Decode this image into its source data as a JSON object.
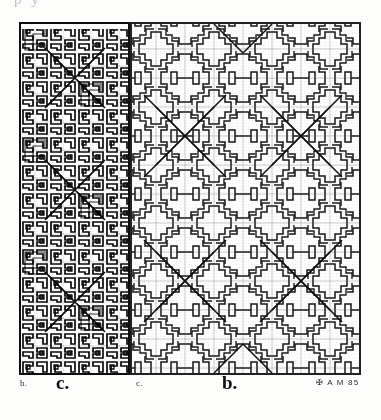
{
  "plate": {
    "title": "Stepped-fret geometric pattern plate",
    "running_header_ghost": "p                                        y",
    "background_color": "#ffffff",
    "ink_color": "#1a1a1a",
    "border_color": "#222222"
  },
  "panels": [
    {
      "id": "panel-dense",
      "label": "c.",
      "description": "Dense inked meander pattern, fine scale, heavy outlines with hatched diagonals",
      "scale": "fine",
      "cell_px": 14,
      "stroke_px": 1.6,
      "x": 0,
      "y": 0,
      "width": 111,
      "height": 353
    },
    {
      "id": "panel-light",
      "label": "b.",
      "description": "Open drafted stepped-cross pattern with light construction grid and diagonal rays",
      "scale": "coarse",
      "cell_px": 29,
      "stroke_px": 1.5,
      "x": 111,
      "y": 0,
      "width": 231,
      "height": 353
    }
  ],
  "captions": [
    {
      "name": "caption-b-small",
      "text": "b."
    },
    {
      "name": "caption-c-large",
      "text": "c."
    },
    {
      "name": "caption-c-small",
      "text": "c."
    },
    {
      "name": "caption-b-large",
      "text": "b."
    }
  ],
  "signature": {
    "text": "✠ A M 85",
    "note": "artist monogram with year"
  },
  "pattern_spec": {
    "motif": "stepped terraced cross / fret",
    "symmetry": "4-fold, mirrored about cell centers",
    "diagonals": "X rays converging at lattice junctions",
    "grid_lines": true
  }
}
